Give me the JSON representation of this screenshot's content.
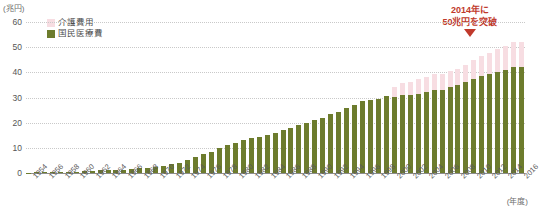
{
  "axes": {
    "y_unit": "(兆円)",
    "x_unit": "(年度)",
    "y_ticks": [
      "60",
      "50",
      "40",
      "30",
      "20",
      "10",
      "0"
    ]
  },
  "legend": {
    "items": [
      {
        "label": "介護費用",
        "color": "#f7dde2",
        "name": "legend-care"
      },
      {
        "label": "国民医療費",
        "color": "#6d7c2d",
        "name": "legend-medical"
      }
    ]
  },
  "annotation": {
    "line1": "2014年に",
    "line2": "50兆円を突破",
    "color": "#c0392b",
    "arrow": "down-arrow"
  },
  "chart_data": {
    "type": "bar",
    "stacked": true,
    "title": "",
    "xlabel": "(年度)",
    "ylabel": "(兆円)",
    "ylim": [
      0,
      60
    ],
    "grid": true,
    "legend_position": "top-left",
    "categories": [
      "1954",
      "1955",
      "1956",
      "1957",
      "1958",
      "1959",
      "1960",
      "1961",
      "1962",
      "1963",
      "1964",
      "1965",
      "1966",
      "1967",
      "1968",
      "1969",
      "1970",
      "1971",
      "1972",
      "1973",
      "1974",
      "1975",
      "1976",
      "1977",
      "1978",
      "1979",
      "1980",
      "1981",
      "1982",
      "1983",
      "1984",
      "1985",
      "1986",
      "1987",
      "1988",
      "1989",
      "1990",
      "1991",
      "1992",
      "1993",
      "1994",
      "1995",
      "1996",
      "1997",
      "1998",
      "1999",
      "2000",
      "2001",
      "2002",
      "2003",
      "2004",
      "2005",
      "2006",
      "2007",
      "2008",
      "2009",
      "2010",
      "2011",
      "2012",
      "2013",
      "2014",
      "2015",
      "2016"
    ],
    "tick_labels": [
      "1954",
      "1956",
      "1958",
      "1960",
      "1962",
      "1964",
      "1966",
      "1968",
      "1970",
      "1972",
      "1974",
      "1976",
      "1978",
      "1980",
      "1982",
      "1984",
      "1986",
      "1988",
      "1990",
      "1992",
      "1994",
      "1996",
      "1998",
      "2000",
      "2002",
      "2004",
      "2006",
      "2008",
      "2010",
      "2012",
      "2014",
      "2016"
    ],
    "series": [
      {
        "name": "国民医療費",
        "color": "#6d7c2d",
        "values": [
          0.2,
          0.3,
          0.3,
          0.4,
          0.4,
          0.5,
          0.6,
          0.8,
          0.9,
          1.1,
          1.3,
          1.1,
          1.3,
          1.5,
          1.8,
          2.1,
          2.5,
          2.7,
          3.4,
          4.0,
          5.3,
          6.5,
          7.6,
          8.5,
          10.0,
          11.0,
          12.0,
          13.0,
          14.0,
          14.5,
          15.0,
          16.0,
          17.0,
          18.0,
          19.0,
          20.0,
          21.0,
          22.0,
          23.5,
          24.4,
          26.0,
          27.0,
          28.5,
          29.0,
          29.5,
          30.7,
          30.4,
          31.1,
          31.0,
          31.5,
          32.1,
          33.1,
          33.1,
          34.1,
          34.8,
          36.0,
          37.4,
          38.6,
          39.2,
          40.1,
          40.8,
          42.3,
          42.1
        ]
      },
      {
        "name": "介護費用",
        "color": "#f7dde2",
        "values": [
          0,
          0,
          0,
          0,
          0,
          0,
          0,
          0,
          0,
          0,
          0,
          0,
          0,
          0,
          0,
          0,
          0,
          0,
          0,
          0,
          0,
          0,
          0,
          0,
          0,
          0,
          0,
          0,
          0,
          0,
          0,
          0,
          0,
          0,
          0,
          0,
          0,
          0,
          0,
          0,
          0,
          0,
          0,
          0,
          0,
          0,
          3.6,
          4.6,
          5.2,
          5.7,
          6.2,
          6.4,
          6.4,
          6.4,
          6.7,
          7.0,
          7.4,
          7.8,
          8.4,
          9.0,
          9.5,
          9.8,
          10.0
        ]
      }
    ],
    "annotations": [
      {
        "text": "2014年に 50兆円を突破",
        "at_category": "2014",
        "color": "#c0392b"
      }
    ]
  }
}
